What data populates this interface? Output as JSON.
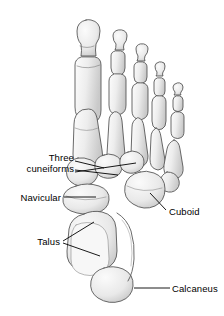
{
  "figure": {
    "style": "grayscale medical illustration",
    "background_color": "#ffffff",
    "bone_fill": "#ececec",
    "bone_outline": "#4a4a4a",
    "leader_color": "#000000",
    "text_color": "#000000"
  },
  "labels": [
    {
      "id": "three-cuneiforms",
      "line1": "Three",
      "line2": "cuneiforms",
      "side": "left",
      "leader": "three-branch"
    },
    {
      "id": "navicular",
      "line1": "Navicular",
      "line2": "",
      "side": "left",
      "leader": "horizontal"
    },
    {
      "id": "talus",
      "line1": "Talus",
      "line2": "",
      "side": "left",
      "leader": "two-branch"
    },
    {
      "id": "cuboid",
      "line1": "Cuboid",
      "line2": "",
      "side": "right",
      "leader": "diagonal"
    },
    {
      "id": "calcaneus",
      "line1": "Calcaneus",
      "line2": "",
      "side": "right",
      "leader": "horizontal"
    }
  ],
  "structures": [
    {
      "name": "distal-phalanges",
      "count": 5
    },
    {
      "name": "middle-phalanges",
      "count": 4
    },
    {
      "name": "proximal-phalanges",
      "count": 5
    },
    {
      "name": "metatarsals",
      "count": 5
    },
    {
      "name": "cuneiforms",
      "count": 3
    },
    {
      "name": "navicular",
      "count": 1
    },
    {
      "name": "cuboid",
      "count": 1
    },
    {
      "name": "talus",
      "count": 1
    },
    {
      "name": "calcaneus",
      "count": 1
    }
  ]
}
